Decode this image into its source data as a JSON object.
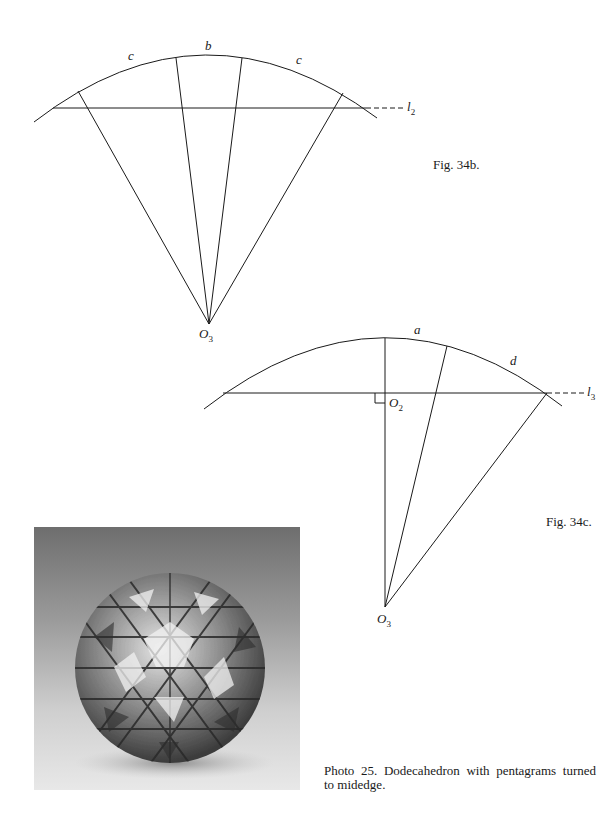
{
  "figure_34b": {
    "caption": "Fig. 34b.",
    "arc_labels": {
      "left": "c",
      "middle": "b",
      "right": "c"
    },
    "line_label": "l",
    "line_label_sub": "2",
    "center_label": "O",
    "center_label_sub": "3"
  },
  "figure_34c": {
    "caption": "Fig. 34c.",
    "arc_labels": {
      "top": "a",
      "right": "d"
    },
    "foot_label": "O",
    "foot_label_sub": "2",
    "line_label": "l",
    "line_label_sub": "3",
    "center_label": "O",
    "center_label_sub": "3"
  },
  "photo": {
    "subject": "Dodecahedron with pentagrams turned to midedge (model photograph)",
    "caption_line1": "Photo 25. Dodecahedron with pentagrams turned",
    "caption_line2": "to midedge."
  },
  "colors": {
    "ink": "#1a1a1a",
    "paper": "#ffffff"
  }
}
